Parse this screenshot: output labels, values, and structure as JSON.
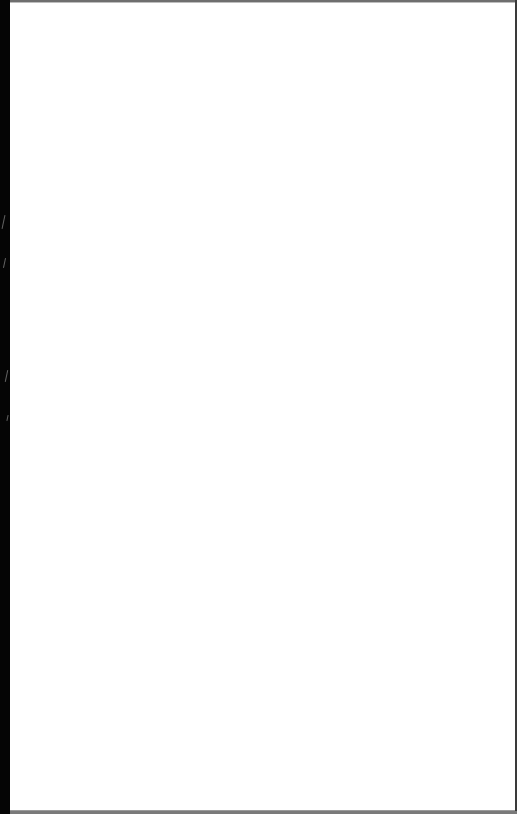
{
  "screen": {
    "state": "blank",
    "content_text": "",
    "colors": {
      "panel_background": "#ffffff",
      "frame": "#0a0a0a",
      "left_band": "#050505"
    }
  }
}
